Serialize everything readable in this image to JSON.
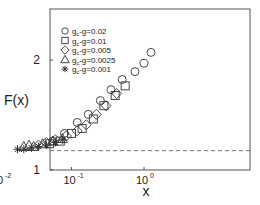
{
  "chart_data": {
    "type": "scatter",
    "title": "",
    "xlabel": "x",
    "ylabel": "F(x)",
    "xscale": "log",
    "yscale": "log",
    "xlim": [
      0.005,
      2.9
    ],
    "ylim": [
      1,
      2.76
    ],
    "x_ticks": [
      {
        "value": 0.01,
        "base": "10",
        "exp": "-2"
      },
      {
        "value": 0.1,
        "base": "10",
        "exp": "-1"
      },
      {
        "value": 1,
        "base": "10",
        "exp": "0"
      }
    ],
    "y_ticks": [
      {
        "value": 1,
        "label": "1"
      },
      {
        "value": 2,
        "label": "2"
      }
    ],
    "grid": false,
    "legend_position": "upper left",
    "reference_line": {
      "style": "dashed",
      "y": 1.13
    },
    "series": [
      {
        "name": "g_c-g=0.02",
        "label_main": "g",
        "label_sub": "c",
        "label_rest": "-g=0.02",
        "marker": "circle",
        "points": [
          [
            0.055,
            1.2
          ],
          [
            0.08,
            1.26
          ],
          [
            0.12,
            1.35
          ],
          [
            0.17,
            1.42
          ],
          [
            0.25,
            1.55
          ],
          [
            0.35,
            1.66
          ],
          [
            0.5,
            1.77
          ],
          [
            0.75,
            1.86
          ],
          [
            1.0,
            1.96
          ],
          [
            1.25,
            2.1
          ]
        ]
      },
      {
        "name": "g_c-g=0.01",
        "label_main": "g",
        "label_sub": "c",
        "label_rest": "-g=0.01",
        "marker": "square",
        "points": [
          [
            0.05,
            1.18
          ],
          [
            0.07,
            1.2
          ],
          [
            0.1,
            1.26
          ],
          [
            0.14,
            1.3
          ],
          [
            0.2,
            1.38
          ],
          [
            0.28,
            1.5
          ],
          [
            0.4,
            1.6
          ],
          [
            0.55,
            1.7
          ]
        ]
      },
      {
        "name": "g_c-g=0.005",
        "label_main": "g",
        "label_sub": "c",
        "label_rest": "-g=0.005",
        "marker": "diamond",
        "points": [
          [
            0.035,
            1.17
          ],
          [
            0.045,
            1.19
          ],
          [
            0.06,
            1.21
          ],
          [
            0.085,
            1.24
          ],
          [
            0.12,
            1.28
          ],
          [
            0.16,
            1.33
          ],
          [
            0.22,
            1.42
          ],
          [
            0.3,
            1.5
          ],
          [
            0.42,
            1.62
          ]
        ]
      },
      {
        "name": "g_c-g=0.0025",
        "label_main": "g",
        "label_sub": "c",
        "label_rest": "-g=0.0025",
        "marker": "triangle",
        "points": [
          [
            0.022,
            1.16
          ],
          [
            0.026,
            1.17
          ],
          [
            0.03,
            1.16
          ],
          [
            0.04,
            1.18
          ],
          [
            0.055,
            1.2
          ],
          [
            0.075,
            1.22
          ]
        ]
      },
      {
        "name": "g_c-g=0.001",
        "label_main": "g",
        "label_sub": "c",
        "label_rest": "-g=0.001",
        "marker": "asterisk",
        "points": [
          [
            0.018,
            1.14
          ],
          [
            0.022,
            1.14
          ],
          [
            0.028,
            1.15
          ],
          [
            0.035,
            1.16
          ],
          [
            0.045,
            1.17
          ],
          [
            0.06,
            1.19
          ],
          [
            0.075,
            1.21
          ]
        ]
      }
    ]
  },
  "plot": {
    "frame": {
      "left": 50,
      "top": 9,
      "right": 250,
      "bottom": 170
    },
    "x_px_per_decade": 72.5,
    "x_ref_px": 144,
    "y_px_per_decade": 365,
    "y_ref_px": 170,
    "stroke_color": "#555555",
    "marker_color": "#333333"
  }
}
